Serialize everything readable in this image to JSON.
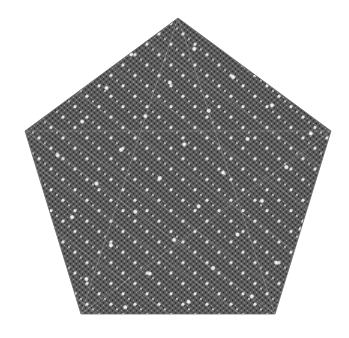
{
  "image": {
    "subject": "pentagon-pattern",
    "description": "Regular pentagon filled with a dense gray dotted fractal-like texture",
    "background_color": "#ffffff",
    "fill_color": "#5a5a5a",
    "dot_color": "#d8d8d8",
    "vertices": [
      [
        178,
        18
      ],
      [
        331,
        131
      ],
      [
        275,
        314
      ],
      [
        81,
        314
      ],
      [
        25,
        131
      ]
    ]
  }
}
